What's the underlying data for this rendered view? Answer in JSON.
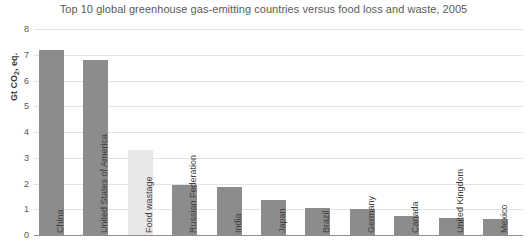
{
  "chart_data": {
    "type": "bar",
    "title": "Top 10 global greenhouse gas-emitting countries versus food loss and waste, 2005",
    "xlabel": "",
    "ylabel": "Gt CO2, eq.",
    "ylabel_base": "Gt CO",
    "ylabel_sub": "2",
    "ylabel_tail": ", eq.",
    "ylim": [
      0,
      8
    ],
    "ytick_values": [
      0,
      1,
      2,
      3,
      4,
      5,
      6,
      7,
      8
    ],
    "ytick_labels": [
      "0",
      "1",
      "2",
      "3",
      "4",
      "5",
      "6",
      "7",
      "8"
    ],
    "grid": true,
    "legend": "none",
    "categories": [
      "China",
      "United States of America",
      "Food wastage",
      "Russian Federation",
      "India",
      "Japan",
      "Brazil",
      "Germany",
      "Canada",
      "United Kingdom",
      "Mexico"
    ],
    "values": [
      7.2,
      6.8,
      3.3,
      1.95,
      1.87,
      1.35,
      1.05,
      1.0,
      0.72,
      0.65,
      0.62
    ],
    "highlight_category": "Food wastage",
    "colors": {
      "bar": "#8c8c8c",
      "bar_highlight": "#e7e7e7",
      "grid": "#e2e2e2",
      "axis": "#8f8f8f",
      "title_text": "#5a5a5a",
      "tick_text": "#555555"
    }
  }
}
